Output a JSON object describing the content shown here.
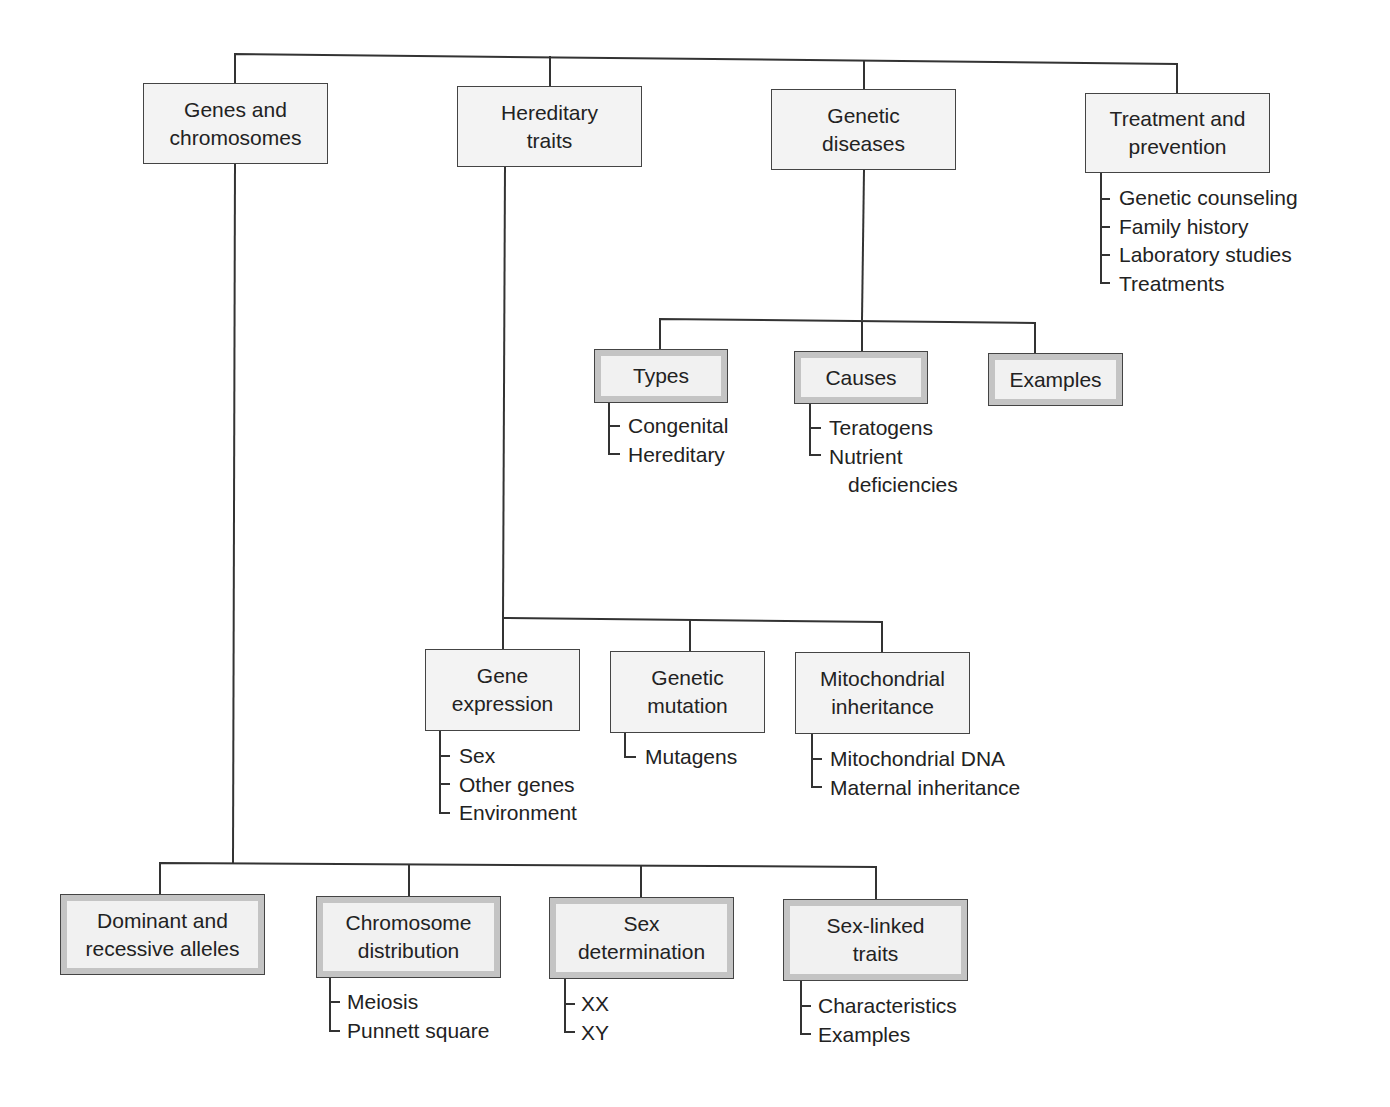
{
  "top": {
    "genes_chromosomes": "Genes and\nchromosomes",
    "hereditary_traits": "Hereditary\ntraits",
    "genetic_diseases": "Genetic\ndiseases",
    "treatment_prevention": "Treatment and\nprevention"
  },
  "treatment_items": [
    "Genetic counseling",
    "Family history",
    "Laboratory studies",
    "Treatments"
  ],
  "diseases": {
    "types": "Types",
    "causes": "Causes",
    "examples": "Examples",
    "types_items": [
      "Congenital",
      "Hereditary"
    ],
    "causes_items": [
      "Teratogens",
      "Nutrient",
      "deficiencies"
    ]
  },
  "traits": {
    "gene_expression": "Gene\nexpression",
    "genetic_mutation": "Genetic\nmutation",
    "mitochondrial": "Mitochondrial\ninheritance",
    "gene_expression_items": [
      "Sex",
      "Other genes",
      "Environment"
    ],
    "mutation_items": [
      "Mutagens"
    ],
    "mitochondrial_items": [
      "Mitochondrial DNA",
      "Maternal inheritance"
    ]
  },
  "genes": {
    "dominant": "Dominant and\nrecessive alleles",
    "chromosome": "Chromosome\ndistribution",
    "sex_determination": "Sex\ndetermination",
    "sex_linked": "Sex-linked\ntraits",
    "chromosome_items": [
      "Meiosis",
      "Punnett square"
    ],
    "sex_det_items": [
      "XX",
      "XY"
    ],
    "sex_linked_items": [
      "Characteristics",
      "Examples"
    ]
  }
}
